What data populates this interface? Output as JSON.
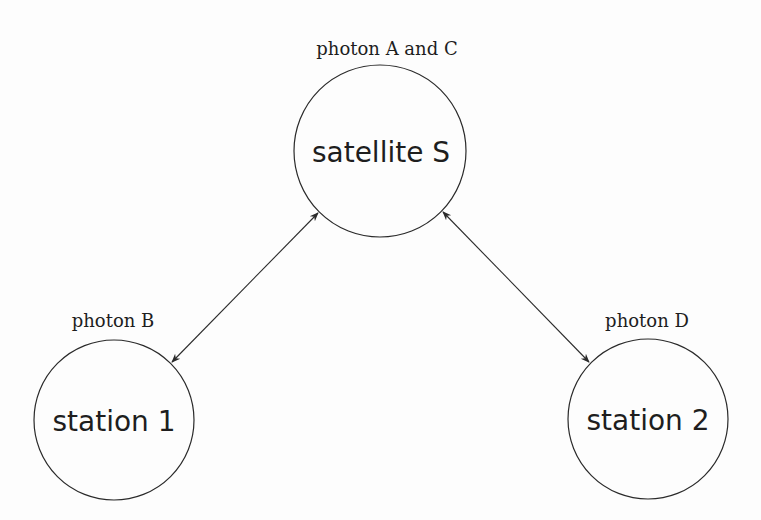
{
  "diagram": {
    "nodes": [
      {
        "id": "satellite",
        "label": "satellite S",
        "annotation": "photon A and C",
        "cx": 380,
        "cy": 151,
        "r": 86
      },
      {
        "id": "station1",
        "label": "station 1",
        "annotation": "photon B",
        "cx": 114,
        "cy": 420,
        "r": 80
      },
      {
        "id": "station2",
        "label": "station 2",
        "annotation": "photon D",
        "cx": 648,
        "cy": 419,
        "r": 80
      }
    ],
    "edges": [
      {
        "from": "satellite",
        "to": "station1",
        "direction": "bidirectional"
      },
      {
        "from": "satellite",
        "to": "station2",
        "direction": "bidirectional"
      }
    ],
    "colors": {
      "stroke": "#2a2a2a",
      "text": "#1e1e1e",
      "background": "#fdfdfd"
    }
  }
}
